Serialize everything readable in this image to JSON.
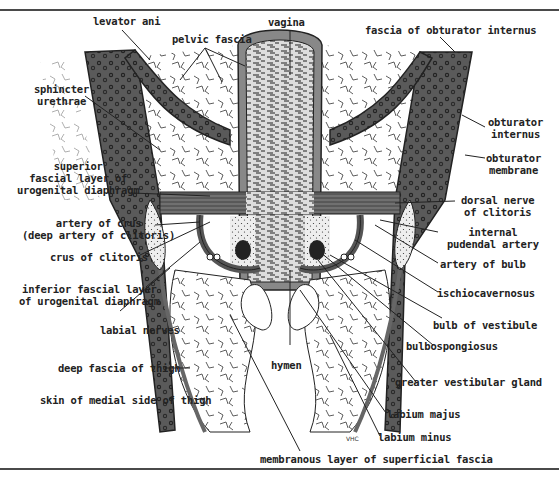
{
  "figure": {
    "artist_signature": "VHC",
    "labels": {
      "levator_ani": "levator ani",
      "pelvic_fascia": "pelvic fascia",
      "vagina": "vagina",
      "fascia_obturator_internus": "fascia of obturator internus",
      "sphincter_urethrae": "sphincter\nurethrae",
      "obturator_internus": "obturator\ninternus",
      "obturator_membrane": "obturator\nmembrane",
      "superior_fascial_layer": "superior\nfascial layer of\nurogenital diaphragm",
      "dorsal_nerve": "dorsal nerve\nof clitoris",
      "internal_pudendal_artery": "internal\npudendal artery",
      "artery_of_crus": "artery of crus\n(deep artery of clitoris)",
      "artery_of_bulb": "artery of bulb",
      "crus_of_clitoris": "crus of clitoris",
      "ischiocavernosus": "ischiocavernosus",
      "inferior_fascial_layer": "inferior fascial layer\nof urogenital diaphragm",
      "bulb_of_vestibule": "bulb of vestibule",
      "labial_nerves": "labial nerves",
      "bulbospongiosus": "bulbospongiosus",
      "hymen": "hymen",
      "deep_fascia_thigh": "deep fascia of thigh",
      "greater_vestibular_gland": "greater vestibular gland",
      "skin_medial_thigh": "skin of medial side of thigh",
      "labium_majus": "labium majus",
      "labium_minus": "labium minus",
      "membranous_layer": "membranous layer of superficial fascia"
    }
  }
}
